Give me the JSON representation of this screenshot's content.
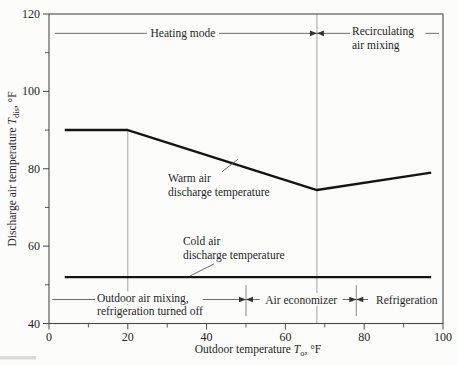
{
  "figure": {
    "background": "#fcfcfb",
    "series_line_color": "#141414",
    "axis_color": "#4a4a4a",
    "annotation_line_color": "#5a5a5a",
    "reference_line_color": "#9a9a9a",
    "boundary_bar_color": "#7a7a7a",
    "text_color": "#1f1f1f"
  },
  "chart_data": {
    "type": "line",
    "title": "",
    "xlabel_parts": [
      {
        "t": "Outdoor temperature "
      },
      {
        "t": "T",
        "style": "italic"
      },
      {
        "t": "o",
        "style": "sub"
      },
      {
        "t": ", °F"
      }
    ],
    "ylabel_parts": [
      {
        "t": "Discharge air temperature "
      },
      {
        "t": "T",
        "style": "italic"
      },
      {
        "t": "dis",
        "style": "sub"
      },
      {
        "t": ", °F"
      }
    ],
    "xlim": [
      0,
      100
    ],
    "ylim": [
      40,
      120
    ],
    "x_ticks": [
      0,
      20,
      40,
      60,
      80,
      100
    ],
    "y_ticks": [
      40,
      60,
      80,
      100,
      120
    ],
    "x_minor_ticks": [
      10,
      30,
      50,
      70,
      90
    ],
    "y_minor_ticks": [
      50,
      70,
      90,
      110
    ],
    "grid": "off",
    "series": [
      {
        "name": "warm-air-discharge-temperature",
        "points": [
          [
            4,
            90
          ],
          [
            20,
            90
          ],
          [
            68,
            74.5
          ],
          [
            97,
            79
          ]
        ]
      },
      {
        "name": "cold-air-discharge-temperature",
        "points": [
          [
            4,
            52
          ],
          [
            97,
            52
          ]
        ]
      }
    ],
    "reference_lines": [
      {
        "x": 20,
        "y1": 41.5,
        "y2": 90
      },
      {
        "x": 68,
        "y1": 40,
        "y2": 120
      }
    ],
    "boundary_bars": [
      {
        "x": 50,
        "y1": 41.9,
        "y2": 49.9
      },
      {
        "x": 78,
        "y1": 41.9,
        "y2": 49.9
      }
    ],
    "spanlines": [
      {
        "name": "heating-mode",
        "y": 115,
        "x1": 1.5,
        "x2": 68,
        "arrow": "right",
        "lines": [
          "Heating mode"
        ],
        "label_x": 34,
        "align": "center"
      },
      {
        "name": "recirculating-air-mixing",
        "y": 115,
        "x1": 68,
        "x2": 99,
        "arrow": "left",
        "lines": [
          "Recirculating",
          "air mixing"
        ],
        "label_x": 76.9,
        "align": "left"
      },
      {
        "name": "outdoor-air-mixing-refrigeration-off",
        "y": 46.2,
        "x1": 0.8,
        "x2": 50,
        "arrow": "right",
        "lines": [
          "Outdoor air mixing,",
          "refrigeration turned off"
        ],
        "label_x": 12.2,
        "align": "left"
      },
      {
        "name": "air-economizer",
        "y": 46.2,
        "x1": 50,
        "x2": 78,
        "arrow": "both",
        "lines": [
          "Air economizer"
        ],
        "label_x": 64,
        "align": "center"
      },
      {
        "name": "refrigeration",
        "y": 46.2,
        "x1": 78,
        "x2": 99.8,
        "arrow": "left",
        "lines": [
          "Refrigeration"
        ],
        "label_x": 90.8,
        "align": "center"
      }
    ],
    "series_labels": [
      {
        "name": "warm-air-label",
        "x": 30.2,
        "y": 77.6,
        "lines": [
          "Warm air",
          "discharge temperature"
        ],
        "leader": [
          [
            43.9,
            79.2
          ],
          [
            48,
            82.5
          ]
        ]
      },
      {
        "name": "cold-air-label",
        "x": 34,
        "y": 61.3,
        "lines": [
          "Cold air",
          "discharge temperature"
        ],
        "leader": [
          [
            41.9,
            55.4
          ],
          [
            35.8,
            52.3
          ]
        ]
      }
    ]
  }
}
